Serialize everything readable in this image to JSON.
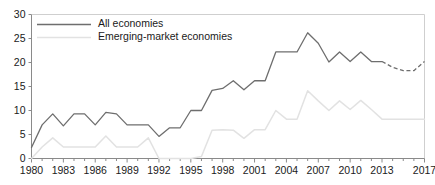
{
  "chart_data": {
    "type": "line",
    "title": "",
    "xlabel": "",
    "ylabel": "",
    "xlim": [
      1980,
      2017
    ],
    "ylim": [
      0,
      30
    ],
    "ytick_values": [
      0,
      5,
      10,
      15,
      20,
      25,
      30
    ],
    "ytick_labels": [
      "0",
      "5",
      "10",
      "15",
      "20",
      "25",
      "30"
    ],
    "xtick_values": [
      1980,
      1983,
      1986,
      1989,
      1992,
      1995,
      1998,
      2001,
      2004,
      2007,
      2010,
      2013,
      2017
    ],
    "xtick_labels": [
      "1980",
      "1983",
      "1986",
      "1989",
      "1992",
      "1995",
      "1998",
      "2001",
      "2004",
      "2007",
      "2010",
      "2013",
      "2017"
    ],
    "minor_ticks_every": 1,
    "grid": false,
    "legend_position": "top-left",
    "x": [
      1980,
      1981,
      1982,
      1983,
      1984,
      1985,
      1986,
      1987,
      1988,
      1989,
      1990,
      1991,
      1992,
      1993,
      1994,
      1995,
      1996,
      1997,
      1998,
      1999,
      2000,
      2001,
      2002,
      2003,
      2004,
      2005,
      2006,
      2007,
      2008,
      2009,
      2010,
      2011,
      2012,
      2013,
      2014,
      2015,
      2016,
      2017
    ],
    "series": [
      {
        "name": "All economies",
        "color": "#6e6e6e",
        "style": "solid",
        "values": [
          2.3,
          7.0,
          9.3,
          6.8,
          9.3,
          9.3,
          7.0,
          9.6,
          9.3,
          7.0,
          7.0,
          7.0,
          4.6,
          6.4,
          6.4,
          10.0,
          10.0,
          14.2,
          14.6,
          16.2,
          14.3,
          16.2,
          16.2,
          22.2,
          22.2,
          22.2,
          26.2,
          24.0,
          20.1,
          22.2,
          20.2,
          22.2,
          20.2,
          20.2,
          19.0,
          18.3,
          18.3,
          20.2
        ],
        "forecast_from": 2013,
        "forecast_style": "dashed"
      },
      {
        "name": "Emerging-market economies",
        "color": "#e2e2e2",
        "style": "solid",
        "values": [
          0.0,
          2.4,
          4.3,
          2.4,
          2.4,
          2.4,
          2.4,
          4.7,
          2.4,
          2.4,
          2.4,
          4.3,
          0.0,
          0.0,
          0.0,
          0.0,
          0.4,
          5.9,
          6.0,
          5.9,
          4.2,
          6.0,
          6.0,
          10.0,
          8.2,
          8.2,
          14.1,
          12.0,
          10.0,
          12.0,
          10.2,
          12.1,
          10.2,
          8.2,
          8.2,
          8.2,
          8.2,
          8.2
        ]
      }
    ]
  },
  "legend": {
    "items": [
      {
        "label": "All economies"
      },
      {
        "label": "Emerging-market economies"
      }
    ]
  },
  "colors": {
    "all_economies": "#6e6e6e",
    "emerging_markets": "#e2e2e2",
    "axis": "#8a8a8a",
    "text": "#1a1a1a",
    "background": "#ffffff"
  }
}
